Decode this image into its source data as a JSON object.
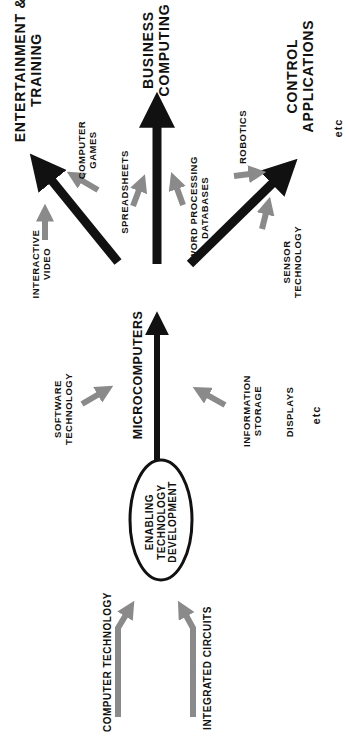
{
  "diagram": {
    "orientation": "rotated 90 degrees counter-clockwise",
    "colors": {
      "main_arrow": "#111111",
      "input_arrow": "#8a8a8a",
      "background": "#ffffff"
    },
    "root_inputs": [
      {
        "label": "COMPUTER TECHNOLOGY"
      },
      {
        "label": "INTEGRATED CIRCUITS"
      }
    ],
    "center_node": {
      "line1": "ENABLING",
      "line2": "TECHNOLOGY",
      "line3": "DEVELOPMENT",
      "shape": "ellipse"
    },
    "middle_node": {
      "label": "MICROCOMPUTERS"
    },
    "middle_inputs": {
      "software": {
        "line1": "SOFTWARE",
        "line2": "TECHNOLOGY"
      },
      "info": {
        "line1": "INFORMATION",
        "line2": "STORAGE"
      },
      "displays": "DISPLAYS",
      "etc": "etc"
    },
    "outcomes": {
      "entertainment": {
        "line1": "ENTERTAINMENT  &",
        "line2": "TRAINING"
      },
      "business": {
        "line1": "BUSINESS",
        "line2": "COMPUTING"
      },
      "control": {
        "line1": "CONTROL",
        "line2": "APPLICATIONS"
      },
      "etc": "etc"
    },
    "outcome_inputs": {
      "interactive": {
        "line1": "INTERACTIVE",
        "line2": "VIDEO"
      },
      "games": {
        "line1": "COMPUTER",
        "line2": "GAMES"
      },
      "spreadsheets": "SPREADSHEETS",
      "word": {
        "line1": "WORD  PROCESSING",
        "line2": "DATABASES"
      },
      "robotics": "ROBOTICS",
      "sensor": {
        "line1": "SENSOR",
        "line2": "TECHNOLOGY"
      }
    }
  }
}
